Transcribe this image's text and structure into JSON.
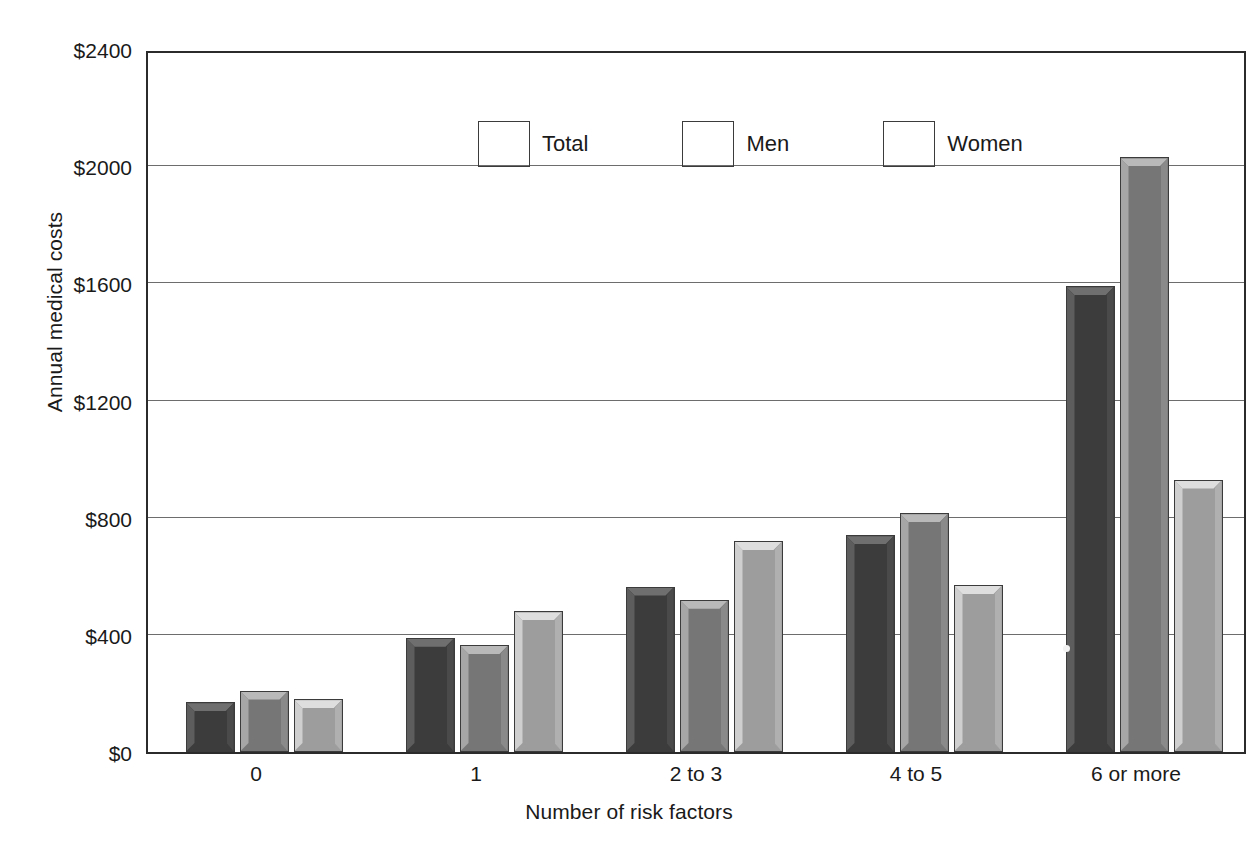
{
  "chart_data": {
    "type": "bar",
    "title": "",
    "xlabel": "Number of risk factors",
    "ylabel": "Annual medical costs",
    "categories": [
      "0",
      "1",
      "2 to 3",
      "4 to 5",
      "6 or more"
    ],
    "ytick_labels": [
      "$0",
      "$400",
      "$800",
      "$1200",
      "$1600",
      "$2000",
      "$2400"
    ],
    "ytick_values": [
      0,
      400,
      800,
      1200,
      1600,
      2000,
      2400
    ],
    "ylim": [
      0,
      2400
    ],
    "grid": "horizontal",
    "legend_position": "inside-top-left",
    "series": [
      {
        "name": "Total",
        "color": "#3c3c3c",
        "values": [
          170,
          390,
          565,
          740,
          1590
        ]
      },
      {
        "name": "Men",
        "color": "#767676",
        "values": [
          210,
          365,
          520,
          815,
          2030
        ]
      },
      {
        "name": "Women",
        "color": "#9d9d9d",
        "values": [
          180,
          480,
          720,
          570,
          930
        ]
      }
    ]
  },
  "axes": {
    "y_title": "Annual medical costs",
    "x_title": "Number of risk factors"
  },
  "legend": {
    "items": [
      {
        "label": "Total"
      },
      {
        "label": "Men"
      },
      {
        "label": "Women"
      }
    ]
  }
}
